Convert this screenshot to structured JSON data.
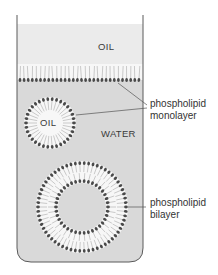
{
  "diagram": {
    "regions": {
      "oil_top": "OIL",
      "oil_droplet": "OIL",
      "water": "WATER"
    },
    "labels": {
      "monolayer_line1": "phospholipid",
      "monolayer_line2": "monolayer",
      "bilayer_line1": "phospholipid",
      "bilayer_line2": "bilayer"
    },
    "colors": {
      "oil": "#ebebeb",
      "water": "#d9d9d9",
      "head": "#4a4a4a",
      "tail": "#ffffff",
      "outline": "#5a5a5a"
    }
  }
}
